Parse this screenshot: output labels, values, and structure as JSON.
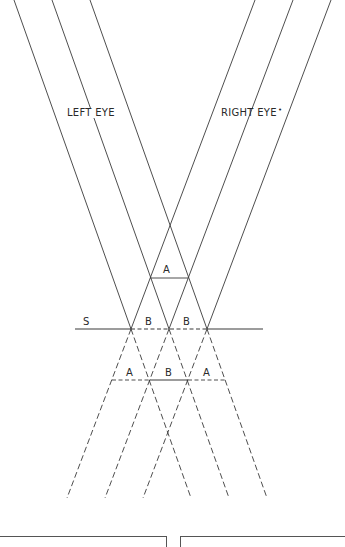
{
  "labels": {
    "left_eye": "LEFT EYE",
    "right_eye": "RIGHT EYE",
    "right_eye_dot": "•",
    "screen": "S",
    "a_top": "A",
    "b_left": "B",
    "b_right": "B",
    "a_bottom_left": "A",
    "b_bottom": "B",
    "a_bottom_right": "A"
  },
  "colors": {
    "line": "#3a3a3a",
    "background": "#ffffff"
  }
}
